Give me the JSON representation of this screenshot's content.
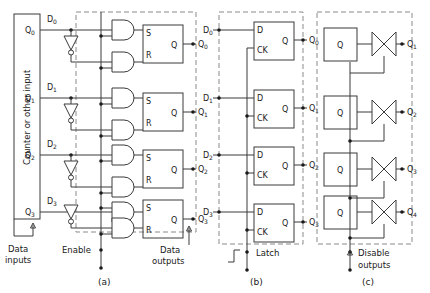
{
  "figure": {
    "caption_a": "(a)",
    "caption_b": "(b)",
    "caption_c": "(c)"
  },
  "panel_a": {
    "source_block_label": "Counter or other input",
    "source_outputs": [
      "Q0",
      "Q1",
      "Q2",
      "Q3"
    ],
    "source_outputs_base": [
      "Q",
      "Q",
      "Q",
      "Q"
    ],
    "source_outputs_sub": [
      "0",
      "1",
      "2",
      "3"
    ],
    "data_inputs_base": [
      "D",
      "D",
      "D",
      "D"
    ],
    "data_inputs_sub": [
      "0",
      "1",
      "2",
      "3"
    ],
    "latch_pin_s": "S",
    "latch_pin_r": "R",
    "latch_pin_q": "Q",
    "outputs_base": [
      "Q",
      "Q",
      "Q",
      "Q"
    ],
    "outputs_sub": [
      "0",
      "1",
      "2",
      "3"
    ],
    "data_inputs_label_line1": "Data",
    "data_inputs_label_line2": "inputs",
    "enable_label": "Enable",
    "data_outputs_label_line1": "Data",
    "data_outputs_label_line2": "outputs",
    "inverter_icon": "inverter-triangle-with-bubble",
    "gate_icon": "and-gate"
  },
  "panel_b": {
    "data_inputs_base": [
      "D",
      "D",
      "D",
      "D"
    ],
    "data_inputs_sub": [
      "0",
      "1",
      "2",
      "3"
    ],
    "ff_pin_d": "D",
    "ff_pin_ck": "CK",
    "ff_pin_q": "Q",
    "outputs_base": [
      "Q",
      "Q",
      "Q",
      "Q"
    ],
    "outputs_sub": [
      "0",
      "1",
      "2",
      "3"
    ],
    "latch_label": "Latch",
    "latch_edge_icon": "rising-edge-step-icon"
  },
  "panel_c": {
    "block_label": "Q",
    "buffer_icon": "tristate-bowtie-buffer",
    "outputs_base": [
      "Q",
      "Q",
      "Q",
      "Q"
    ],
    "outputs_sub": [
      "1",
      "2",
      "3",
      "4"
    ],
    "disable_label_line1": "Disable",
    "disable_label_line2": "outputs"
  },
  "colors": {
    "line": "#3a3a3a",
    "dashed": "#8a8a8a",
    "text": "#1a1a1a",
    "background": "#ffffff"
  }
}
